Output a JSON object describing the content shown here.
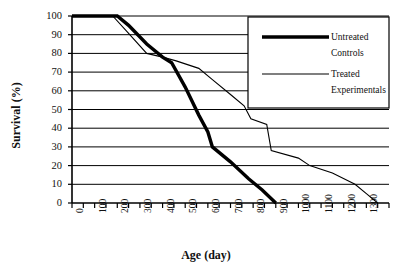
{
  "chart_data": {
    "type": "line",
    "title": "",
    "xlabel": "Age (day)",
    "ylabel": "Survival (%)",
    "xlim": [
      0,
      1400
    ],
    "ylim": [
      0,
      100
    ],
    "xticks": [
      0,
      100,
      200,
      300,
      400,
      500,
      600,
      700,
      800,
      900,
      1000,
      1100,
      1200,
      1300
    ],
    "yticks": [
      0,
      10,
      20,
      30,
      40,
      50,
      60,
      70,
      80,
      90,
      100
    ],
    "grid": "horizontal",
    "legend_position": "top-right",
    "series": [
      {
        "name": "Untreated Controls",
        "style": "thick",
        "color": "#000000",
        "points": [
          [
            0,
            100
          ],
          [
            200,
            100
          ],
          [
            250,
            95
          ],
          [
            330,
            85
          ],
          [
            400,
            78
          ],
          [
            440,
            75
          ],
          [
            500,
            62
          ],
          [
            560,
            47
          ],
          [
            600,
            38
          ],
          [
            620,
            30
          ],
          [
            700,
            22
          ],
          [
            780,
            13
          ],
          [
            840,
            7
          ],
          [
            900,
            0
          ]
        ]
      },
      {
        "name": "Treated Experimentals",
        "style": "thin",
        "color": "#000000",
        "points": [
          [
            0,
            100
          ],
          [
            180,
            100
          ],
          [
            240,
            92
          ],
          [
            330,
            80
          ],
          [
            400,
            78
          ],
          [
            460,
            76
          ],
          [
            560,
            72
          ],
          [
            620,
            66
          ],
          [
            700,
            58
          ],
          [
            760,
            52
          ],
          [
            790,
            45
          ],
          [
            860,
            42
          ],
          [
            880,
            28
          ],
          [
            1000,
            24
          ],
          [
            1050,
            20
          ],
          [
            1150,
            16
          ],
          [
            1250,
            10
          ],
          [
            1300,
            5
          ],
          [
            1350,
            0
          ]
        ]
      }
    ],
    "legend": [
      {
        "label_line1": "Untreated",
        "label_line2": "Controls",
        "style": "thick"
      },
      {
        "label_line1": "Treated",
        "label_line2": "Experimentals",
        "style": "thin"
      }
    ]
  },
  "axes": {
    "y_title": "Survival (%)",
    "x_title": "Age (day)",
    "y_tick_labels": [
      "100",
      "90",
      "80",
      "70",
      "60",
      "50",
      "40",
      "30",
      "20",
      "10",
      "0"
    ],
    "x_tick_labels": [
      "0",
      "100",
      "200",
      "300",
      "400",
      "500",
      "600",
      "700",
      "800",
      "900",
      "1100",
      "1200",
      "1300"
    ]
  },
  "legend": {
    "untreated_line1": "Untreated",
    "untreated_line2": "Controls",
    "treated_line1": "Treated",
    "treated_line2": "Experimentals"
  }
}
